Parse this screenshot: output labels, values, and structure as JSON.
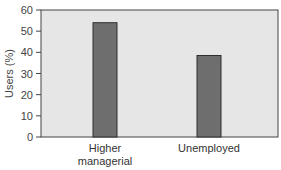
{
  "chart_data": {
    "type": "bar",
    "title": "",
    "xlabel": "",
    "ylabel": "Users (%)",
    "categories": [
      [
        "Higher",
        "managerial"
      ],
      [
        "Unemployed"
      ]
    ],
    "values": [
      54,
      38.5
    ],
    "ylim": [
      0,
      60
    ],
    "yticks": [
      0,
      10,
      20,
      30,
      40,
      50,
      60
    ],
    "grid": false,
    "legend": "none",
    "colors": {
      "bar": "#6e6e6e",
      "bar_edge": "#2e2e2e",
      "plot_bg": "#e6e6e6",
      "axis": "#444444"
    }
  }
}
